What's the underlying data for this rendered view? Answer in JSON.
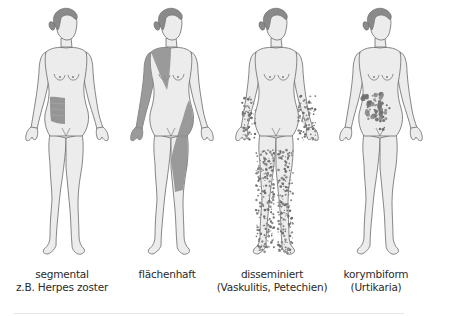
{
  "figures": [
    {
      "id": "segmental",
      "label_line1": "segmental",
      "label_line2": "z.B. Herpes zoster",
      "pattern": "segmental"
    },
    {
      "id": "flaechenhaft",
      "label_line1": "flächenhaft",
      "label_line2": "",
      "pattern": "flaechenhaft"
    },
    {
      "id": "disseminiert",
      "label_line1": "disseminiert",
      "label_line2": "(Vaskulitis, Petechien)",
      "pattern": "disseminiert"
    },
    {
      "id": "korymbiform",
      "label_line1": "korymbiform",
      "label_line2": "(Urtikaria)",
      "pattern": "korymbiform"
    }
  ],
  "colors": {
    "skin": "#ececec",
    "outline": "#6a6a6a",
    "hair": "#8a8a8a",
    "lesion": "#8c8c8c",
    "lesion_dark": "#6e6e6e"
  }
}
